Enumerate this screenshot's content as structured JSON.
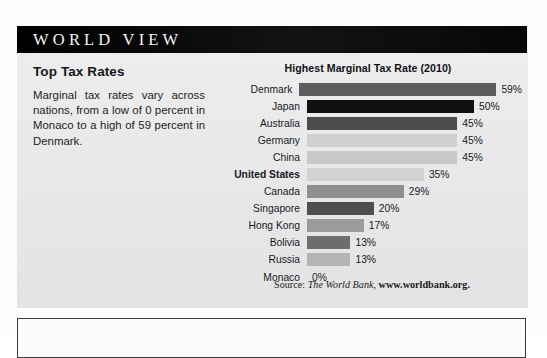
{
  "banner": {
    "title": "WORLD VIEW"
  },
  "article": {
    "heading": "Top Tax Rates",
    "body": "Marginal tax rates vary across nations, from a low of 0 percent in Monaco to a high of 59 percent in Denmark."
  },
  "source": {
    "label": "Source:",
    "publication": "The World Bank,",
    "url": "www.worldbank.org."
  },
  "chart_data": {
    "type": "bar",
    "orientation": "horizontal",
    "title": "Highest Marginal Tax Rate (2010)",
    "xlabel": "",
    "ylabel": "",
    "xlim": [
      0,
      59
    ],
    "grid": false,
    "legend": null,
    "value_suffix": "%",
    "categories": [
      "Denmark",
      "Japan",
      "Australia",
      "Germany",
      "China",
      "United States",
      "Canada",
      "Singapore",
      "Hong Kong",
      "Bolivia",
      "Russia",
      "Monaco"
    ],
    "values": [
      59,
      50,
      45,
      45,
      45,
      35,
      29,
      20,
      17,
      13,
      13,
      0
    ],
    "value_labels": [
      "59%",
      "50%",
      "45%",
      "45%",
      "45%",
      "35%",
      "29%",
      "20%",
      "17%",
      "13%",
      "13%",
      "0%"
    ],
    "bar_colors": [
      "#5c5c5c",
      "#101010",
      "#4c4c4c",
      "#cfcfcf",
      "#c9c9c9",
      "#d2d2d2",
      "#8f8f8f",
      "#4e4e4e",
      "#9b9b9b",
      "#6d6d6d",
      "#b4b4b4",
      "#e9e9e9"
    ],
    "highlight_category": "United States",
    "px_per_unit": 3.34
  }
}
